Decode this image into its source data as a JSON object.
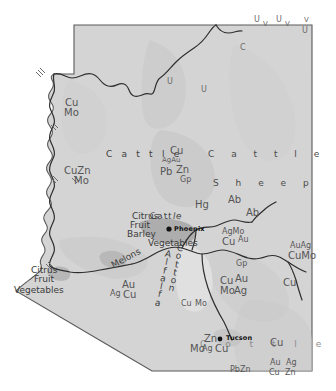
{
  "map": {
    "title": "Arizona Resources and Land Use Map",
    "subject": "Arizona",
    "type": "thematic-resource-map",
    "colors": {
      "land_fill": "#d4d4d4",
      "land_fill_shaded": "#c4c4c4",
      "urban_fill": "#b0b0b0",
      "outline": "#4a4a4a",
      "river": "#2f2f2f",
      "label": "#4a4a4a",
      "city_label": "#111111",
      "background": "#ffffff"
    },
    "cities": [
      {
        "name": "Phoenix",
        "x": 176,
        "y": 228
      },
      {
        "name": "Tucson",
        "x": 228,
        "y": 339
      }
    ],
    "livestock_labels": [
      {
        "text": "C a t t l e",
        "x": 213,
        "y": 155,
        "style": "spread-wide"
      },
      {
        "text": "S h e e p",
        "x": 218,
        "y": 184,
        "style": "spread-wide"
      },
      {
        "text": "C a t t l e",
        "x": 110,
        "y": 155,
        "style": "spread"
      },
      {
        "text": "C a t t l e",
        "x": 154,
        "y": 211,
        "style": "curve"
      },
      {
        "text": "C o t t l e",
        "x": 204,
        "y": 345,
        "style": "spread-faint"
      }
    ],
    "agriculture_labels": [
      {
        "text": "Citrus",
        "x": 134,
        "y": 216
      },
      {
        "text": "Fruit",
        "x": 132,
        "y": 225
      },
      {
        "text": "Barley",
        "x": 130,
        "y": 234
      },
      {
        "text": "Vegetables",
        "x": 152,
        "y": 242
      },
      {
        "text": "Citrus",
        "x": 33,
        "y": 270
      },
      {
        "text": "Fruit",
        "x": 36,
        "y": 279
      },
      {
        "text": "Vegetables",
        "x": 16,
        "y": 290
      },
      {
        "text": "Melons",
        "x": 113,
        "y": 257,
        "rotated": true
      },
      {
        "text": "Cotton",
        "x": 181,
        "y": 250,
        "vertical": true
      },
      {
        "text": "Alfalfa",
        "x": 169,
        "y": 256,
        "vertical": true
      }
    ],
    "mineral_labels": [
      {
        "text": "Cu",
        "x": 67,
        "y": 103
      },
      {
        "text": "Mo",
        "x": 66,
        "y": 113
      },
      {
        "text": "CuZn",
        "x": 68,
        "y": 172
      },
      {
        "text": "Mo",
        "x": 76,
        "y": 181
      },
      {
        "text": "Cu",
        "x": 172,
        "y": 151
      },
      {
        "text": "AgAu",
        "x": 165,
        "y": 161
      },
      {
        "text": "Pb",
        "x": 164,
        "y": 172
      },
      {
        "text": "Zn",
        "x": 178,
        "y": 170
      },
      {
        "text": "Gp",
        "x": 182,
        "y": 180
      },
      {
        "text": "Hg",
        "x": 197,
        "y": 205
      },
      {
        "text": "Ab",
        "x": 230,
        "y": 200
      },
      {
        "text": "Ab",
        "x": 248,
        "y": 213
      },
      {
        "text": "AgMo",
        "x": 224,
        "y": 232
      },
      {
        "text": "Cu",
        "x": 225,
        "y": 242
      },
      {
        "text": "Au",
        "x": 240,
        "y": 240
      },
      {
        "text": "AuAg",
        "x": 292,
        "y": 246
      },
      {
        "text": "CuMo",
        "x": 290,
        "y": 256
      },
      {
        "text": "Cu",
        "x": 285,
        "y": 283
      },
      {
        "text": "Gp",
        "x": 238,
        "y": 264
      },
      {
        "text": "Cu",
        "x": 222,
        "y": 281
      },
      {
        "text": "Au",
        "x": 237,
        "y": 279
      },
      {
        "text": "Mo",
        "x": 222,
        "y": 291
      },
      {
        "text": "Ag",
        "x": 236,
        "y": 291
      },
      {
        "text": "Cu",
        "x": 183,
        "y": 304
      },
      {
        "text": "Mo",
        "x": 197,
        "y": 304
      },
      {
        "text": "Au",
        "x": 124,
        "y": 285
      },
      {
        "text": "Ag",
        "x": 112,
        "y": 294
      },
      {
        "text": "Cu",
        "x": 125,
        "y": 296
      },
      {
        "text": "Mo",
        "x": 192,
        "y": 348
      },
      {
        "text": "Zn",
        "x": 206,
        "y": 340
      },
      {
        "text": "Ag",
        "x": 204,
        "y": 350
      },
      {
        "text": "Cu",
        "x": 217,
        "y": 350
      },
      {
        "text": "Cu",
        "x": 272,
        "y": 343
      },
      {
        "text": "PbZn",
        "x": 232,
        "y": 370
      },
      {
        "text": "Au",
        "x": 272,
        "y": 363
      },
      {
        "text": "Ag",
        "x": 288,
        "y": 363
      },
      {
        "text": "Cu",
        "x": 271,
        "y": 373
      },
      {
        "text": "Zn",
        "x": 287,
        "y": 373
      }
    ],
    "uranium_labels": [
      {
        "text": "U",
        "x": 258,
        "y": 22
      },
      {
        "text": "V",
        "x": 267,
        "y": 25
      },
      {
        "text": "U",
        "x": 280,
        "y": 22
      },
      {
        "text": "V",
        "x": 289,
        "y": 25
      },
      {
        "text": "V",
        "x": 306,
        "y": 25
      },
      {
        "text": "U",
        "x": 304,
        "y": 36
      },
      {
        "text": "C",
        "x": 242,
        "y": 46
      },
      {
        "text": "U",
        "x": 169,
        "y": 80
      },
      {
        "text": "U",
        "x": 203,
        "y": 88
      }
    ],
    "legend_notes": {
      "mineral_symbols": "Cu = copper, Mo = molybdenum, Ag = silver, Au = gold, Pb = lead, Zn = zinc, Gp = gypsum, Hg = mercury, U = uranium, V = vanadium, Ab = asbestos, C = coal"
    }
  }
}
